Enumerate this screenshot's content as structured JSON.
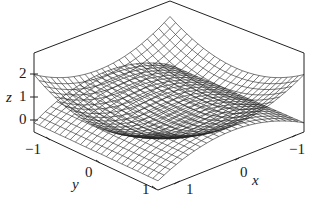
{
  "chart_data": {
    "type": "surface3d",
    "title": "",
    "surfaces": [
      {
        "name": "upper",
        "formula": "z = x^2 + y^2",
        "shape": "paraboloid (bowl)"
      },
      {
        "name": "lower",
        "formula": "z = y^2 - x^2 + 1 (approx saddle below)",
        "shape": "saddle"
      }
    ],
    "xlabel": "x",
    "ylabel": "y",
    "zlabel": "z",
    "xlim": [
      -1,
      1
    ],
    "ylim": [
      -1,
      1
    ],
    "zlim": [
      -0.3,
      2.4
    ],
    "x_ticks": [
      "-1",
      "0",
      "1"
    ],
    "y_ticks": [
      "-1",
      "0",
      "1"
    ],
    "z_ticks": [
      "0",
      "1",
      "2"
    ],
    "grid": false,
    "mesh": "wireframe grid, black on white"
  },
  "axes": {
    "z_label": "z",
    "z_tick_0": "0",
    "z_tick_1": "1",
    "z_tick_2": "2",
    "y_label": "y",
    "y_tick_neg1": "−1",
    "y_tick_0": "0",
    "y_tick_1": "1",
    "x_label": "x",
    "x_tick_neg1": "−1",
    "x_tick_0": "0",
    "x_tick_1": "1"
  }
}
